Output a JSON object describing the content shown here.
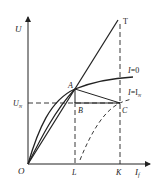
{
  "diagram": {
    "title": "",
    "axes": {
      "y_label": "U",
      "x_label_main": "I",
      "x_label_sub": "f",
      "origin_label": "O"
    },
    "points": {
      "T": "T",
      "A": "A",
      "B": "B",
      "C": "C",
      "L": "L",
      "K": "K"
    },
    "reference": {
      "un_main": "U",
      "un_sub": "N"
    },
    "curves": {
      "no_load_main": "I",
      "no_load_eq": "=0",
      "load_main": "I",
      "load_eq": "=I",
      "load_sub": "N"
    },
    "colors": {
      "line": "#222222",
      "background": "#ffffff"
    }
  }
}
